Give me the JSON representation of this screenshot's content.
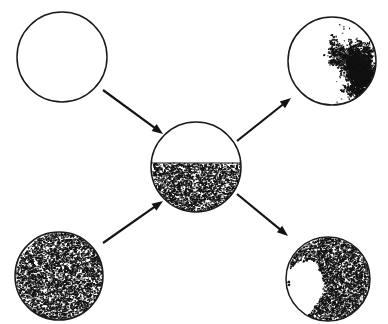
{
  "figure": {
    "background_color": "#ffffff",
    "ink_color": "#1a1a1a",
    "stipple_color": "#121212",
    "width": 388,
    "height": 324,
    "nodes": [
      {
        "id": "top-left",
        "name": "empty-circle-top-left",
        "label": "",
        "cx": 62,
        "cy": 57,
        "r": 45,
        "fill_state": "empty",
        "fill_fraction": 0.0,
        "description": "Outlined circle with no interior texture"
      },
      {
        "id": "bottom-left",
        "name": "full-stipple-circle-bottom-left",
        "label": "",
        "cx": 59,
        "cy": 276,
        "r": 44,
        "fill_state": "uniform-stipple",
        "fill_fraction": 1.0,
        "description": "Circle uniformly filled with dense random stipple"
      },
      {
        "id": "center",
        "name": "half-filled-circle-center",
        "label": "",
        "cx": 196,
        "cy": 167,
        "r": 45,
        "fill_state": "half-stipple",
        "fill_fraction": 0.55,
        "fill_line_y": 163,
        "description": "Circle with clear upper half and stippled lower portion separated by a horizontal interface"
      },
      {
        "id": "top-right",
        "name": "dendrite-cluster-circle-top-right",
        "label": "",
        "cx": 332,
        "cy": 61,
        "r": 44,
        "fill_state": "dendrite-on-wall",
        "fill_fraction": 0.12,
        "cluster_anchor": "right-edge",
        "description": "Mostly clear circle with a branching dendritic aggregate grown inward from the right wall"
      },
      {
        "id": "bottom-right",
        "name": "inverse-dendrite-circle-bottom-right",
        "label": "",
        "cx": 328,
        "cy": 279,
        "r": 42,
        "fill_state": "dense-with-dendritic-void",
        "fill_fraction": 0.85,
        "void_anchor": "left-center",
        "description": "Densely stippled circle containing a white branching dendritic void on the left side"
      }
    ],
    "arrows": [
      {
        "id": "arrow-1",
        "name": "arrow-top-left-to-center",
        "from": "top-left",
        "to": "center",
        "x1": 103,
        "y1": 90,
        "x2": 163,
        "y2": 134,
        "direction": "down-right"
      },
      {
        "id": "arrow-2",
        "name": "arrow-bottom-left-to-center",
        "from": "bottom-left",
        "to": "center",
        "x1": 103,
        "y1": 243,
        "x2": 163,
        "y2": 201,
        "direction": "up-right"
      },
      {
        "id": "arrow-3",
        "name": "arrow-center-to-top-right",
        "from": "center",
        "to": "top-right",
        "x1": 237,
        "y1": 141,
        "x2": 291,
        "y2": 98,
        "direction": "up-right"
      },
      {
        "id": "arrow-4",
        "name": "arrow-center-to-bottom-right",
        "from": "center",
        "to": "bottom-right",
        "x1": 237,
        "y1": 194,
        "x2": 288,
        "y2": 236,
        "direction": "down-right"
      }
    ]
  }
}
